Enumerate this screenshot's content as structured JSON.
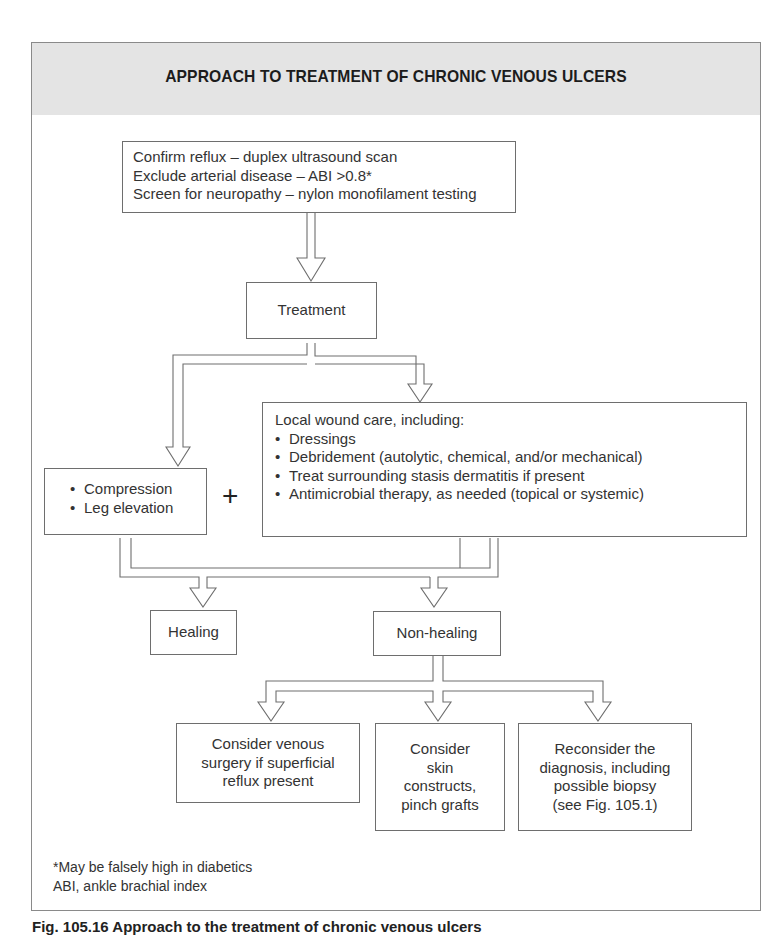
{
  "figure": {
    "title": "APPROACH TO TREATMENT OF CHRONIC VENOUS ULCERS",
    "colors": {
      "header_bg": "#e4e4e4",
      "border": "#6e6e6e",
      "text": "#333333"
    }
  },
  "nodes": {
    "assessment": {
      "lines": [
        "Confirm reflux – duplex ultrasound scan",
        "Exclude arterial disease – ABI >0.8*",
        "Screen for neuropathy – nylon monofilament testing"
      ]
    },
    "treatment": {
      "label": "Treatment"
    },
    "compression": {
      "items": [
        "Compression",
        "Leg elevation"
      ]
    },
    "plus_symbol": "+",
    "wound_care": {
      "heading": "Local wound care, including:",
      "items": [
        "Dressings",
        "Debridement (autolytic, chemical, and/or mechanical)",
        "Treat surrounding stasis dermatitis if present",
        "Antimicrobial therapy, as needed (topical or systemic)"
      ]
    },
    "healing": {
      "label": "Healing"
    },
    "non_healing": {
      "label": "Non-healing"
    },
    "venous_surgery": {
      "lines": [
        "Consider venous",
        "surgery if superficial",
        "reflux present"
      ]
    },
    "skin_constructs": {
      "lines": [
        "Consider",
        "skin",
        "constructs,",
        "pinch grafts"
      ]
    },
    "reconsider": {
      "lines": [
        "Reconsider the",
        "diagnosis, including",
        "possible biopsy",
        "(see Fig. 105.1)"
      ]
    }
  },
  "footnotes": [
    "*May be falsely high in diabetics",
    "ABI, ankle brachial index"
  ],
  "caption": "Fig. 105.16  Approach to the treatment of chronic venous ulcers"
}
